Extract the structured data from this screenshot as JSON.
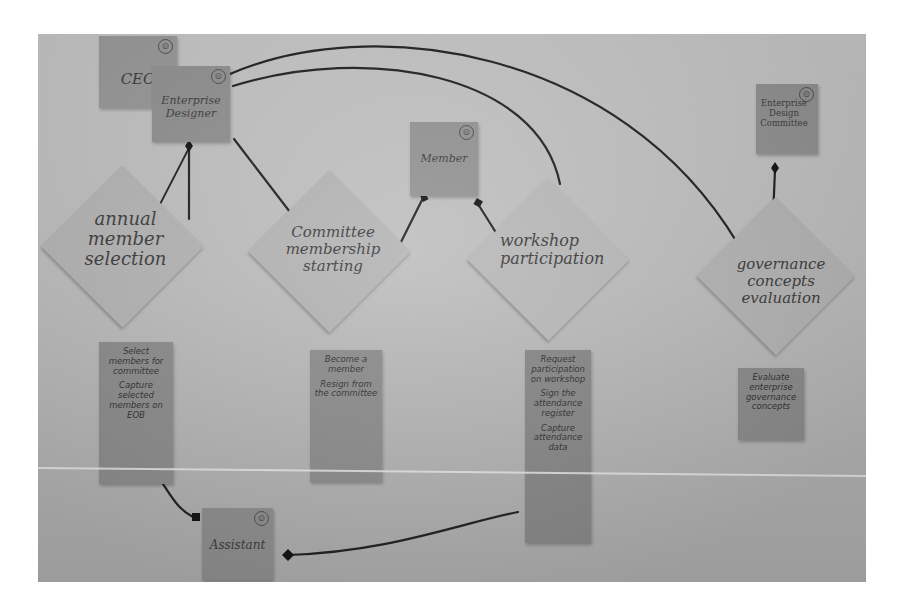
{
  "diagram": {
    "type": "photographed sticky-note process map",
    "actors": {
      "ceo": "CEO",
      "enterprise_designer": "Enterprise Designer",
      "member": "Member",
      "enterprise_design_committee": "Enterprise Design Committee",
      "assistant": "Assistant"
    },
    "activities": [
      {
        "id": "annual",
        "label": "annual member selection",
        "tasks": [
          "Select members for committee",
          "Capture selected members on EOB"
        ]
      },
      {
        "id": "committee",
        "label": "Committee membership starting",
        "tasks": [
          "Become a member",
          "Resign from the committee"
        ]
      },
      {
        "id": "workshop",
        "label": "workshop participation",
        "tasks": [
          "Request participation on workshop",
          "Sign the attendance register",
          "Capture attendance data"
        ]
      },
      {
        "id": "governance",
        "label": "governance concepts evaluation",
        "tasks": [
          "Evaluate enterprise governance concepts"
        ]
      }
    ],
    "actor_icon": "smiley-icon",
    "colors": {
      "background": "#bdbdbd",
      "actor_note": "#8f8f8f",
      "activity_note": "#b3b3b3",
      "task_note": "#8a8a8a",
      "line": "#1e1e1e"
    }
  }
}
